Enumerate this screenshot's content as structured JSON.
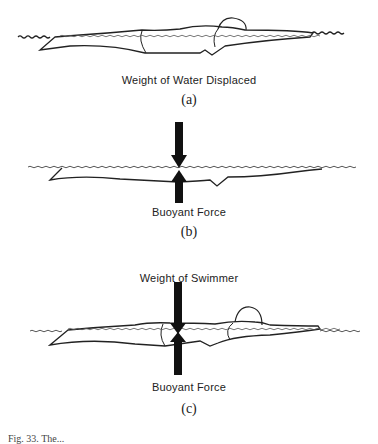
{
  "figure": {
    "panels": [
      {
        "id": "a",
        "label": "Weight of Water Displaced",
        "sublabel": "(a)",
        "arrows": []
      },
      {
        "id": "b",
        "label": "Buoyant Force",
        "sublabel": "(b)",
        "arrows": [
          "down",
          "up"
        ]
      },
      {
        "id": "c",
        "top_label": "Weight of Swimmer",
        "label": "Buoyant Force",
        "sublabel": "(c)",
        "arrows": [
          "down",
          "up"
        ]
      }
    ],
    "caption": "Fig. 33. The..."
  }
}
